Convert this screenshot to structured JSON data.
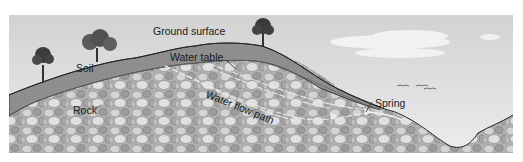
{
  "diagram": {
    "labels": {
      "ground_surface": "Ground surface",
      "water_table": "Water table",
      "soil": "Soil",
      "rock": "Rock",
      "water_flow_path": "Water flow path",
      "spring": "Spring"
    },
    "colors": {
      "sky": "#dcdcdc",
      "soil": "#8c8c8c",
      "rock_base": "#b4b4b4",
      "rock_light": "#d6d6d6",
      "rock_dark": "#8f8f8f",
      "outline": "#2a2a2a",
      "cloud": "#f2f2f2"
    },
    "elements": [
      "trees",
      "clouds",
      "birds",
      "soil layer",
      "rock layer",
      "water table",
      "water flow path",
      "spring",
      "valley"
    ]
  }
}
